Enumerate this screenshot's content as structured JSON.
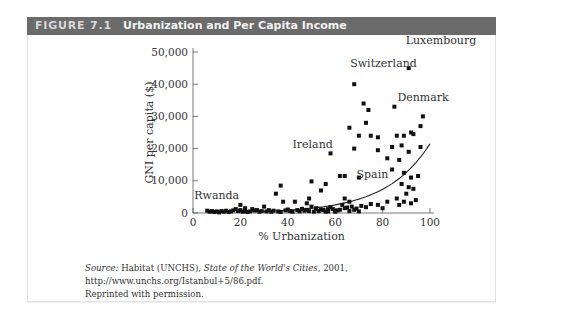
{
  "figure": {
    "label": "FIGURE 7.1",
    "title": "Urbanization and Per Capita Income",
    "header_color": "#6b6b6b"
  },
  "source": {
    "prefix": "Source:",
    "org": " Habitat (UNCHS), ",
    "publication": "State of the World's Cities,",
    "details": " 2001, http://www.unchs.org/Istanbul+5/86.pdf.",
    "line2": "Reprinted with permission."
  },
  "chart_data": {
    "type": "scatter",
    "title": "Urbanization and Per Capita Income",
    "xlabel": "% Urbanization",
    "ylabel": "GNI per capita ($)",
    "xlim": [
      0,
      100
    ],
    "ylim": [
      0,
      50000
    ],
    "x_ticks": [
      0,
      20,
      40,
      60,
      80,
      100
    ],
    "x_tick_labels": [
      "0",
      "20",
      "40",
      "60",
      "80",
      "100"
    ],
    "y_ticks": [
      0,
      10000,
      20000,
      30000,
      40000,
      50000
    ],
    "y_tick_labels": [
      "0",
      "10,000",
      "20,000",
      "30,000",
      "40,000",
      "50,000"
    ],
    "grid": false,
    "legend": null,
    "marker": "square",
    "marker_color": "#111111",
    "annotations": [
      {
        "text": "Luxembourg",
        "x": 91,
        "y": 45000
      },
      {
        "text": "Switzerland",
        "x": 68,
        "y": 40000
      },
      {
        "text": "Denmark",
        "x": 85,
        "y": 33000
      },
      {
        "text": "Ireland",
        "x": 58,
        "y": 18500
      },
      {
        "text": "Spain",
        "x": 69,
        "y": 14500
      },
      {
        "text": "Rwanda",
        "x": 6,
        "y": 300
      }
    ],
    "trend_line": {
      "type": "exponential",
      "points": [
        [
          20,
          300
        ],
        [
          40,
          1200
        ],
        [
          50,
          2200
        ],
        [
          60,
          3800
        ],
        [
          70,
          6300
        ],
        [
          80,
          10200
        ],
        [
          90,
          16000
        ],
        [
          100,
          21500
        ]
      ]
    },
    "points": [
      [
        91,
        45000
      ],
      [
        68,
        40000
      ],
      [
        85,
        33000
      ],
      [
        58,
        18500
      ],
      [
        72,
        34000
      ],
      [
        74,
        32000
      ],
      [
        73,
        28000
      ],
      [
        96,
        27000
      ],
      [
        66,
        26500
      ],
      [
        70,
        24000
      ],
      [
        75,
        24000
      ],
      [
        78,
        23500
      ],
      [
        86,
        24000
      ],
      [
        89,
        24000
      ],
      [
        92,
        25000
      ],
      [
        93,
        24500
      ],
      [
        97,
        30000
      ],
      [
        68,
        20000
      ],
      [
        78,
        19500
      ],
      [
        84,
        20500
      ],
      [
        88,
        21000
      ],
      [
        91,
        19000
      ],
      [
        82,
        17000
      ],
      [
        87,
        16500
      ],
      [
        96,
        20500
      ],
      [
        84,
        13500
      ],
      [
        89,
        12500
      ],
      [
        92,
        11000
      ],
      [
        95,
        11500
      ],
      [
        88,
        9000
      ],
      [
        91,
        8000
      ],
      [
        93,
        7500
      ],
      [
        90,
        6000
      ],
      [
        86,
        4500
      ],
      [
        87,
        2500
      ],
      [
        89,
        3500
      ],
      [
        92,
        3000
      ],
      [
        94,
        4000
      ],
      [
        82,
        3500
      ],
      [
        80,
        1500
      ],
      [
        78,
        2500
      ],
      [
        62,
        11500
      ],
      [
        64,
        11500
      ],
      [
        70,
        11000
      ],
      [
        56,
        9000
      ],
      [
        54,
        7000
      ],
      [
        37,
        8500
      ],
      [
        35,
        6000
      ],
      [
        38,
        3500
      ],
      [
        43,
        3500
      ],
      [
        50,
        9800
      ],
      [
        49,
        4500
      ],
      [
        48,
        3000
      ],
      [
        50,
        2000
      ],
      [
        52,
        1500
      ],
      [
        55,
        1000
      ],
      [
        57,
        500
      ],
      [
        59,
        1200
      ],
      [
        61,
        800
      ],
      [
        63,
        2500
      ],
      [
        65,
        1700
      ],
      [
        67,
        2000
      ],
      [
        69,
        1400
      ],
      [
        71,
        2200
      ],
      [
        73,
        1800
      ],
      [
        75,
        2800
      ],
      [
        66,
        3500
      ],
      [
        64,
        4500
      ],
      [
        60,
        700
      ],
      [
        58,
        1800
      ],
      [
        56,
        400
      ],
      [
        54,
        1100
      ],
      [
        53,
        600
      ],
      [
        20,
        2500
      ],
      [
        30,
        2000
      ],
      [
        25,
        1200
      ],
      [
        27,
        900
      ],
      [
        22,
        1500
      ],
      [
        6,
        700
      ],
      [
        7,
        400
      ],
      [
        8,
        600
      ],
      [
        9,
        300
      ],
      [
        10,
        500
      ],
      [
        11,
        200
      ],
      [
        12,
        600
      ],
      [
        13,
        400
      ],
      [
        14,
        700
      ],
      [
        15,
        300
      ],
      [
        16,
        500
      ],
      [
        17,
        800
      ],
      [
        18,
        1200
      ],
      [
        19,
        600
      ],
      [
        20,
        900
      ],
      [
        21,
        400
      ],
      [
        22,
        700
      ],
      [
        23,
        300
      ],
      [
        24,
        500
      ],
      [
        26,
        800
      ],
      [
        28,
        400
      ],
      [
        29,
        600
      ],
      [
        31,
        500
      ],
      [
        32,
        900
      ],
      [
        33,
        400
      ],
      [
        34,
        700
      ],
      [
        36,
        500
      ],
      [
        37,
        300
      ],
      [
        39,
        800
      ],
      [
        40,
        1100
      ],
      [
        41,
        600
      ],
      [
        42,
        400
      ],
      [
        44,
        900
      ],
      [
        45,
        500
      ],
      [
        46,
        1300
      ],
      [
        47,
        700
      ],
      [
        48,
        1000
      ],
      [
        49,
        600
      ],
      [
        51,
        400
      ],
      [
        52,
        1300
      ],
      [
        55,
        900
      ],
      [
        57,
        1200
      ],
      [
        60,
        400
      ],
      [
        62,
        1000
      ],
      [
        64,
        1500
      ],
      [
        66,
        600
      ],
      [
        68,
        1000
      ],
      [
        70,
        500
      ]
    ]
  }
}
